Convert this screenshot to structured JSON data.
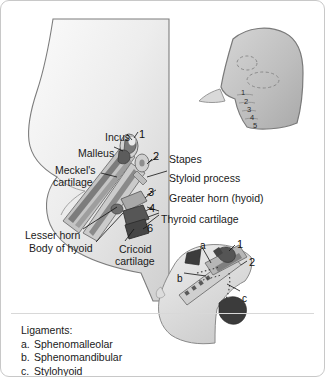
{
  "figure": {
    "border_color": "#c8c8c8",
    "background": "#ffffff"
  },
  "palette": {
    "head_fill_light": "#f2f2f2",
    "head_fill_mid": "#d9d9d9",
    "head_outline": "#6f6f6f",
    "cartilage_light": "#c9c9c9",
    "cartilage_mid": "#9a9a9a",
    "cartilage_dark": "#6a6a6a",
    "bone_dark": "#4a4a4a",
    "bone_darkest": "#3a3a3a",
    "leader_line": "#111111",
    "text": "#1a1a1a"
  },
  "main_figure": {
    "name": "fetal-head-profile-with-arch-cartilages",
    "labels": [
      {
        "id": "incus",
        "text": "Incus",
        "x": 104,
        "y": 130
      },
      {
        "id": "malleus",
        "text": "Malleus",
        "x": 77,
        "y": 146
      },
      {
        "id": "meckels-cartilage-line1",
        "text": "Meckel's",
        "x": 54,
        "y": 163
      },
      {
        "id": "meckels-cartilage-line2",
        "text": "cartilage",
        "x": 52,
        "y": 175
      },
      {
        "id": "lesser-horn",
        "text": "Lesser horn",
        "x": 24,
        "y": 228
      },
      {
        "id": "body-of-hyoid",
        "text": "Body of hyoid",
        "x": 28,
        "y": 241
      },
      {
        "id": "stapes",
        "text": "Stapes",
        "x": 168,
        "y": 152
      },
      {
        "id": "styloid-process",
        "text": "Styloid process",
        "x": 168,
        "y": 171
      },
      {
        "id": "greater-horn-hyoid",
        "text": "Greater horn (hyoid)",
        "x": 168,
        "y": 191
      },
      {
        "id": "thyroid-cartilage",
        "text": "Thyroid cartilage",
        "x": 160,
        "y": 212
      },
      {
        "id": "cricoid-cartilage-line1",
        "text": "Cricoid",
        "x": 118,
        "y": 242
      },
      {
        "id": "cricoid-cartilage-line2",
        "text": "cartilage",
        "x": 114,
        "y": 254
      }
    ],
    "arch_numbers": [
      {
        "id": "arch-1",
        "text": "1",
        "x": 138,
        "y": 128
      },
      {
        "id": "arch-2",
        "text": "2",
        "x": 152,
        "y": 150
      },
      {
        "id": "arch-3",
        "text": "3",
        "x": 147,
        "y": 186
      },
      {
        "id": "arch-4",
        "text": "4",
        "x": 148,
        "y": 202
      },
      {
        "id": "arch-6",
        "text": "6",
        "x": 146,
        "y": 222
      }
    ]
  },
  "inset_top_right": {
    "name": "embryo-head-pharyngeal-arches",
    "arch_numbers": [
      {
        "id": "tr-arch-1",
        "text": "1",
        "x": 240,
        "y": 88
      },
      {
        "id": "tr-arch-2",
        "text": "2",
        "x": 243,
        "y": 97
      },
      {
        "id": "tr-arch-3",
        "text": "3",
        "x": 246,
        "y": 105
      },
      {
        "id": "tr-arch-4",
        "text": "4",
        "x": 249,
        "y": 113
      },
      {
        "id": "tr-arch-5",
        "text": "5",
        "x": 252,
        "y": 121
      }
    ]
  },
  "inset_bottom": {
    "name": "adult-profile-ligament-derivatives",
    "labels": [
      {
        "id": "lig-a",
        "text": "a",
        "x": 199,
        "y": 239
      },
      {
        "id": "lig-b",
        "text": "b",
        "x": 176,
        "y": 272
      },
      {
        "id": "lig-c",
        "text": "c",
        "x": 241,
        "y": 292
      },
      {
        "id": "inset-num-1",
        "text": "1",
        "x": 236,
        "y": 238
      },
      {
        "id": "inset-num-2",
        "text": "2",
        "x": 248,
        "y": 256
      }
    ]
  },
  "legend": {
    "title": "Ligaments:",
    "items": [
      {
        "key": "a.",
        "text": "Sphenomalleolar"
      },
      {
        "key": "b.",
        "text": "Sphenomandibular"
      },
      {
        "key": "c.",
        "text": "Stylohyoid"
      }
    ]
  }
}
